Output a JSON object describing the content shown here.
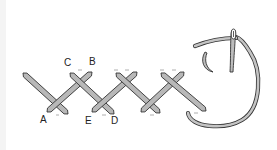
{
  "diagram": {
    "title": "",
    "colors": {
      "thread_fill": "#b8b8b8",
      "thread_outline": "#333333",
      "background": "#ffffff",
      "dash": "#888888"
    },
    "labels": [
      {
        "id": "A",
        "text": "A",
        "x": 40,
        "y": 115
      },
      {
        "id": "C",
        "text": "C",
        "x": 64,
        "y": 58
      },
      {
        "id": "B",
        "text": "B",
        "x": 89,
        "y": 57
      },
      {
        "id": "E",
        "text": "E",
        "x": 85,
        "y": 116
      },
      {
        "id": "D",
        "text": "D",
        "x": 111,
        "y": 116
      }
    ],
    "stitches": [
      {
        "name": "stitch-1-back",
        "x1": 23,
        "y1": 73,
        "x2": 68,
        "y2": 114
      },
      {
        "name": "stitch-1-front",
        "x1": 47,
        "y1": 112,
        "x2": 92,
        "y2": 72
      },
      {
        "name": "stitch-2-back",
        "x1": 70,
        "y1": 73,
        "x2": 114,
        "y2": 114
      },
      {
        "name": "stitch-2-front",
        "x1": 92,
        "y1": 112,
        "x2": 137,
        "y2": 72
      },
      {
        "name": "stitch-3-back",
        "x1": 116,
        "y1": 73,
        "x2": 160,
        "y2": 113
      },
      {
        "name": "stitch-3-front",
        "x1": 141,
        "y1": 112,
        "x2": 184,
        "y2": 72
      },
      {
        "name": "stitch-4-back",
        "x1": 161,
        "y1": 73,
        "x2": 206,
        "y2": 111
      }
    ],
    "elements": [
      "needle",
      "working-thread-loop",
      "direction-arrow"
    ]
  }
}
